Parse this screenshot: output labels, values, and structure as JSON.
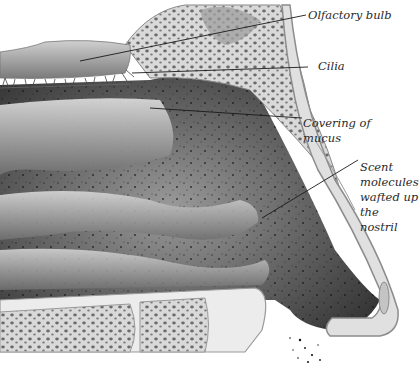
{
  "figure": {
    "labels": {
      "olfactory_bulb": "Olfactory bulb",
      "cilia": "Cilia",
      "mucus": [
        "Covering of",
        "mucus"
      ],
      "scent": [
        "Scent",
        "molecules",
        "wafted up",
        "the nostril"
      ]
    },
    "colors": {
      "background": "#ffffff",
      "cavity_dark": "#3a3a3a",
      "tissue_mid": "#8a8a8a",
      "bone": "#d6d6d6",
      "bone_pores": "#6e6e6e",
      "leader_line": "#1a1a1a",
      "label_text": "#2a2a2a"
    }
  }
}
